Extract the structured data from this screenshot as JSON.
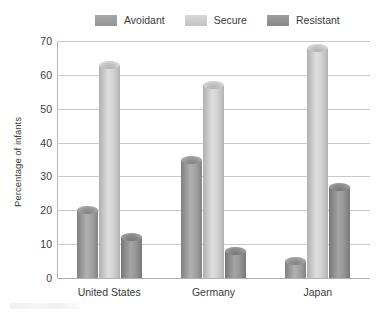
{
  "chart_data": {
    "type": "bar",
    "title": "",
    "subtitle": "",
    "xlabel": "",
    "ylabel": "Percentage of infants",
    "categories": [
      "United States",
      "Germany",
      "Japan"
    ],
    "series": [
      {
        "name": "Avoidant",
        "color": "#9a9a9a",
        "values": [
          20,
          35,
          5
        ]
      },
      {
        "name": "Secure",
        "color": "#c9c9c9",
        "values": [
          63,
          57,
          68
        ]
      },
      {
        "name": "Resistant",
        "color": "#8f8f8f",
        "values": [
          12,
          8,
          27
        ]
      }
    ],
    "ylim": [
      0,
      70
    ],
    "y_ticks": [
      0,
      10,
      20,
      30,
      40,
      50,
      60,
      70
    ],
    "y_tick_labels": [
      "0",
      "10",
      "20",
      "30",
      "40",
      "50",
      "60",
      "70"
    ],
    "grid": true,
    "legend_position": "top-center",
    "style": "3d-cylinder"
  },
  "legend": {
    "items": [
      {
        "label": "Avoidant",
        "color": "#9a9a9a"
      },
      {
        "label": "Secure",
        "color": "#c9c9c9"
      },
      {
        "label": "Resistant",
        "color": "#8f8f8f"
      }
    ]
  },
  "axes": {
    "y_title": "Percentage of infants",
    "y_tick_labels": [
      "70",
      "60",
      "50",
      "40",
      "30",
      "20",
      "10",
      "0"
    ],
    "x_tick_labels": [
      "United States",
      "Germany",
      "Japan"
    ]
  },
  "colors": {
    "avoidant": "#9a9a9a",
    "secure": "#c9c9c9",
    "resistant": "#8f8f8f",
    "gridline": "#c9c9c9",
    "axis": "#b0b0b0",
    "text": "#3a3a3a",
    "background": "#ffffff"
  }
}
